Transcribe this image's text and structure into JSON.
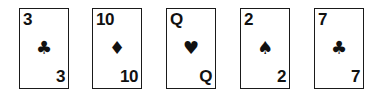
{
  "cards": [
    {
      "rank": "3",
      "suit": "clubs",
      "suit_glyph": "♣",
      "left": 19
    },
    {
      "rank": "10",
      "suit": "diamonds",
      "suit_glyph": "♦",
      "left": 92
    },
    {
      "rank": "Q",
      "suit": "hearts",
      "suit_glyph": "♥",
      "left": 166
    },
    {
      "rank": "2",
      "suit": "spades",
      "suit_glyph": "♠",
      "left": 240
    },
    {
      "rank": "7",
      "suit": "clubs",
      "suit_glyph": "♣",
      "left": 314
    }
  ]
}
